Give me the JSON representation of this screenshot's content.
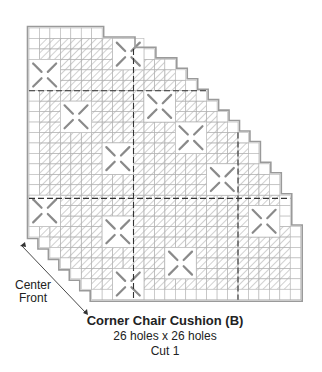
{
  "diagram": {
    "title": "Corner Chair Cushion (B)",
    "size": "26 holes x 26 holes",
    "cut": "Cut 1",
    "direction_label_line1": "Center",
    "direction_label_line2": "Front",
    "grid": {
      "holes_wide": 26,
      "holes_high": 26,
      "origin_x": 29,
      "origin_y": 28,
      "cell": 10.45,
      "row_right_extent": [
        7,
        10,
        12,
        14,
        15,
        16,
        17,
        18,
        19,
        20,
        21,
        22,
        22,
        23,
        24,
        24,
        25,
        25,
        25,
        26,
        26,
        26,
        26,
        26,
        26,
        26
      ],
      "row_left_extent": [
        0,
        0,
        0,
        0,
        0,
        0,
        0,
        0,
        0,
        0,
        0,
        0,
        0,
        0,
        0,
        0,
        0,
        0,
        0,
        0,
        1,
        2,
        3,
        4,
        5,
        6
      ],
      "dashed_cols": [
        10,
        20
      ],
      "dashed_rows": [
        6,
        16.3
      ]
    },
    "colors": {
      "outline": "#9a9a9a",
      "grid": "#b5b5b5",
      "hatch": "#8a8a8a",
      "dashed": "#333333",
      "text": "#222222"
    }
  }
}
